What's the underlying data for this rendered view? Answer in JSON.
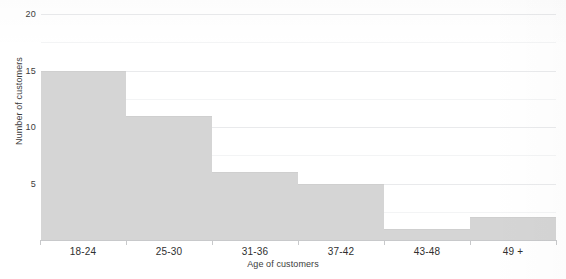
{
  "chart_data": {
    "type": "bar",
    "title": "",
    "subtitle": "",
    "xlabel": "Age of customers",
    "ylabel": "Number of customers",
    "categories": [
      "18-24",
      "25-30",
      "31-36",
      "37-42",
      "43-48",
      "49 +"
    ],
    "values": [
      15,
      11,
      6,
      5,
      1,
      2
    ],
    "ylim": [
      0,
      20
    ],
    "y_ticks": [
      0,
      5,
      10,
      15,
      20
    ],
    "y_tick_labels": [
      "",
      "5",
      "10",
      "15",
      "20"
    ],
    "grid": true,
    "grid_axis": "y",
    "legend": null,
    "bar_style": "contiguous-histogram",
    "bar_color": "#d5d5d5",
    "gridline_color": "#e9eaec",
    "axis_color": "#c8c9cb",
    "text_color": "#3c3c3c",
    "background": "#ffffff"
  },
  "axes": {
    "y": {
      "title": "Number of customers",
      "ticks": [
        {
          "label": "20",
          "value": 20
        },
        {
          "label": "15",
          "value": 15
        },
        {
          "label": "10",
          "value": 10
        },
        {
          "label": "5",
          "value": 5
        }
      ]
    },
    "x": {
      "title": "Age of customers",
      "ticks": [
        {
          "label": "18-24"
        },
        {
          "label": "25-30"
        },
        {
          "label": "31-36"
        },
        {
          "label": "37-42"
        },
        {
          "label": "43-48"
        },
        {
          "label": "49 +"
        }
      ]
    }
  },
  "bars": [
    {
      "category": "18-24",
      "value": 15
    },
    {
      "category": "25-30",
      "value": 11
    },
    {
      "category": "31-36",
      "value": 6
    },
    {
      "category": "37-42",
      "value": 5
    },
    {
      "category": "43-48",
      "value": 1
    },
    {
      "category": "49 +",
      "value": 2
    }
  ]
}
